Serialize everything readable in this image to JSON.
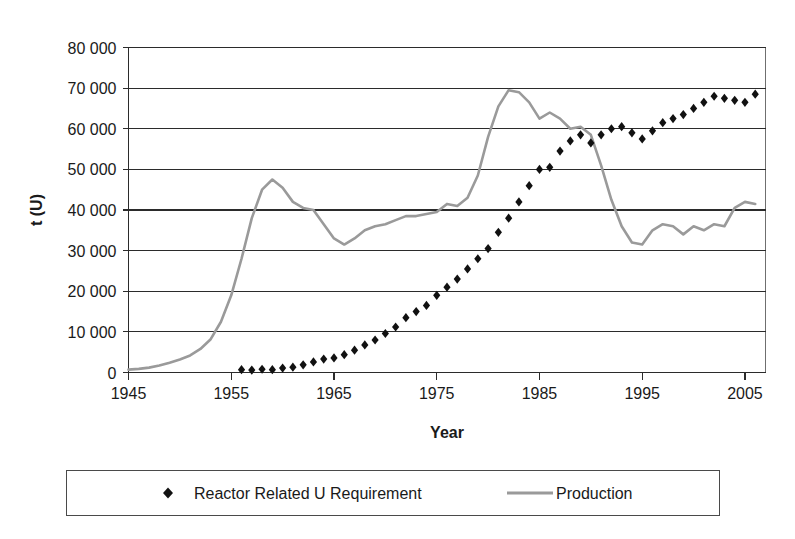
{
  "chart_data": {
    "type": "line",
    "title": "",
    "xlabel": "Year",
    "ylabel": "t (U)",
    "xlim": [
      1945,
      2007
    ],
    "ylim": [
      0,
      80000
    ],
    "xticks": [
      1945,
      1955,
      1965,
      1975,
      1985,
      1995,
      2005
    ],
    "xtick_labels": [
      "1945",
      "1955",
      "1965",
      "1975",
      "1985",
      "1995",
      "2005"
    ],
    "yticks": [
      0,
      10000,
      20000,
      30000,
      40000,
      50000,
      60000,
      70000,
      80000
    ],
    "ytick_labels": [
      "0",
      "10 000",
      "20 000",
      "30 000",
      "40 000",
      "50 000",
      "60 000",
      "70 000",
      "80 000"
    ],
    "grid": "horizontal",
    "legend_position": "bottom",
    "series": [
      {
        "name": "Reactor Related U Requirement",
        "marker": "diamond",
        "style": "markers",
        "color": "#111111",
        "x": [
          1956,
          1957,
          1958,
          1959,
          1960,
          1961,
          1962,
          1963,
          1964,
          1965,
          1966,
          1967,
          1968,
          1969,
          1970,
          1971,
          1972,
          1973,
          1974,
          1975,
          1976,
          1977,
          1978,
          1979,
          1980,
          1981,
          1982,
          1983,
          1984,
          1985,
          1986,
          1987,
          1988,
          1989,
          1990,
          1991,
          1992,
          1993,
          1994,
          1995,
          1996,
          1997,
          1998,
          1999,
          2000,
          2001,
          2002,
          2003,
          2004,
          2005,
          2006
        ],
        "y": [
          700,
          600,
          800,
          700,
          1100,
          1300,
          1900,
          2600,
          3300,
          3600,
          4400,
          5500,
          6800,
          8000,
          9600,
          11200,
          13500,
          15000,
          16500,
          19000,
          21000,
          23000,
          25500,
          28000,
          30500,
          34500,
          38000,
          42000,
          46000,
          50000,
          50500,
          54500,
          57000,
          58500,
          56500,
          58500,
          60000,
          60500,
          59000,
          57500,
          59500,
          61500,
          62500,
          63500,
          65000,
          66500,
          68000,
          67500,
          67000,
          66500,
          68500
        ]
      },
      {
        "name": "Production",
        "marker": "none",
        "style": "line",
        "color": "#9a9a9a",
        "x": [
          1945,
          1946,
          1947,
          1948,
          1949,
          1950,
          1951,
          1952,
          1953,
          1954,
          1955,
          1956,
          1957,
          1958,
          1959,
          1960,
          1961,
          1962,
          1963,
          1964,
          1965,
          1966,
          1967,
          1968,
          1969,
          1970,
          1971,
          1972,
          1973,
          1974,
          1975,
          1976,
          1977,
          1978,
          1979,
          1980,
          1981,
          1982,
          1983,
          1984,
          1985,
          1986,
          1987,
          1988,
          1989,
          1990,
          1991,
          1992,
          1993,
          1994,
          1995,
          1996,
          1997,
          1998,
          1999,
          2000,
          2001,
          2002,
          2003,
          2004,
          2005,
          2006
        ],
        "y": [
          700,
          900,
          1200,
          1700,
          2400,
          3200,
          4200,
          5800,
          8200,
          12500,
          19000,
          28000,
          38000,
          45000,
          47500,
          45500,
          42000,
          40500,
          40000,
          36500,
          33000,
          31500,
          33000,
          35000,
          36000,
          36500,
          37500,
          38500,
          38500,
          39000,
          39500,
          41500,
          41000,
          43000,
          48500,
          58000,
          65500,
          69500,
          69000,
          66500,
          62500,
          64000,
          62500,
          60000,
          60500,
          58500,
          51000,
          42500,
          36000,
          32000,
          31500,
          35000,
          36500,
          36000,
          34000,
          36000,
          35000,
          36500,
          36000,
          40500,
          42000,
          41500
        ]
      }
    ]
  },
  "legend": {
    "entries": [
      {
        "label": "Reactor Related U Requirement",
        "symbol": "diamond-marker",
        "color": "#111111"
      },
      {
        "label": "Production",
        "symbol": "line-swatch",
        "color": "#9a9a9a"
      }
    ]
  },
  "colors": {
    "production_line": "#9a9a9a",
    "requirement_marker": "#111111",
    "gridline": "#2b2b2b",
    "frame": "#6f6f6f",
    "background": "#ffffff"
  }
}
